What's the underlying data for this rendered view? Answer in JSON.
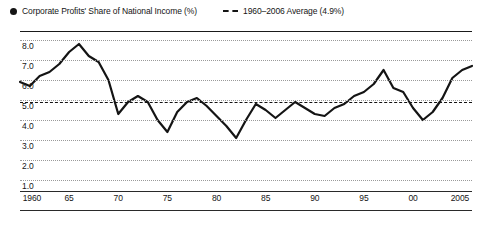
{
  "legend": {
    "entries": [
      {
        "marker": "solid-dot",
        "label": "Corporate Profits' Share of National Income (%)"
      },
      {
        "marker": "dashed-line",
        "label": "1960–2006 Average (4.9%)"
      }
    ]
  },
  "chart_data": {
    "type": "line",
    "title": "",
    "subtitle": "",
    "xlabel": "",
    "ylabel": "",
    "xlim": [
      1960,
      2006
    ],
    "ylim": [
      0.4,
      8.4
    ],
    "grid": true,
    "legend_position": "top-left",
    "y_ticks": [
      "8.0",
      "7.0",
      "6.0",
      "5.0",
      "4.0",
      "3.0",
      "2.0",
      "1.0"
    ],
    "y_tick_values": [
      8.0,
      7.0,
      6.0,
      5.0,
      4.0,
      3.0,
      2.0,
      1.0
    ],
    "x_ticks": [
      "1960",
      "65",
      "70",
      "75",
      "80",
      "85",
      "90",
      "95",
      "00",
      "2005"
    ],
    "x_tick_values": [
      1960,
      1965,
      1970,
      1975,
      1980,
      1985,
      1990,
      1995,
      2000,
      2005
    ],
    "reference_line": {
      "label": "1960–2006 Average (4.9%)",
      "value": 4.9,
      "style": "dashed"
    },
    "series": [
      {
        "name": "Corporate Profits' Share of National Income (%)",
        "color": "#141414",
        "x": [
          1960,
          1961,
          1962,
          1963,
          1964,
          1965,
          1966,
          1967,
          1968,
          1969,
          1970,
          1971,
          1972,
          1973,
          1974,
          1975,
          1976,
          1977,
          1978,
          1979,
          1980,
          1981,
          1982,
          1983,
          1984,
          1985,
          1986,
          1987,
          1988,
          1989,
          1990,
          1991,
          1992,
          1993,
          1994,
          1995,
          1996,
          1997,
          1998,
          1999,
          2000,
          2001,
          2002,
          2003,
          2004,
          2005,
          2006
        ],
        "values": [
          5.9,
          5.7,
          6.2,
          6.4,
          6.8,
          7.4,
          7.8,
          7.2,
          6.9,
          6.0,
          4.3,
          4.9,
          5.2,
          4.9,
          4.0,
          3.4,
          4.4,
          4.9,
          5.1,
          4.7,
          4.2,
          3.7,
          3.1,
          4.0,
          4.8,
          4.5,
          4.1,
          4.5,
          4.9,
          4.6,
          4.3,
          4.2,
          4.6,
          4.8,
          5.2,
          5.4,
          5.8,
          6.5,
          5.6,
          5.4,
          4.6,
          4.0,
          4.4,
          5.1,
          6.1,
          6.5,
          6.7
        ]
      }
    ]
  },
  "colors": {
    "series_line": "#141414",
    "reference_line": "#121212",
    "gridline": "#9a9a9a",
    "axis": "#1a1a1a",
    "text": "#151515",
    "background": "#ffffff"
  }
}
